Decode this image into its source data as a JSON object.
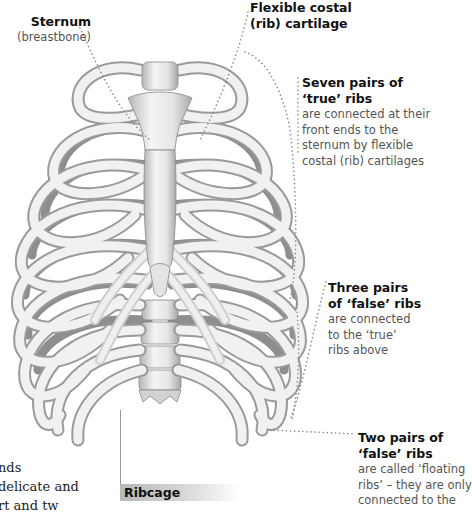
{
  "figure": {
    "caption": "Ribcage",
    "colors": {
      "bone_light": "#f2f2f2",
      "bone_shadow": "#9a9a9a",
      "leader_dots": "#8a8a8a",
      "title_text": "#111111",
      "desc_text": "#555555"
    }
  },
  "labels": {
    "sternum": {
      "title": "Sternum",
      "desc": "(breastbone)"
    },
    "costal_cartilage": {
      "title_line1": "Flexible costal",
      "title_line2": "(rib) cartilage"
    },
    "true_ribs": {
      "title_line1": "Seven pairs of",
      "title_line2": "‘true’ ribs",
      "desc_lines": [
        "are connected at their",
        "front ends to the",
        "sternum by flexible",
        "costal (rib) cartilages"
      ]
    },
    "three_false_ribs": {
      "title_line1": "Three pairs",
      "title_line2": "of ‘false’ ribs",
      "desc_lines": [
        "are connected",
        "to the ‘true’",
        "ribs above"
      ]
    },
    "two_false_ribs": {
      "title_line1": "Two pairs of",
      "title_line2": "‘false’ ribs",
      "desc_lines": [
        "are called ‘floating",
        "ribs’ – they are only",
        "connected to the"
      ]
    }
  },
  "body_text": {
    "lines": [
      "nds",
      "delicate and",
      "rt and tw"
    ]
  }
}
